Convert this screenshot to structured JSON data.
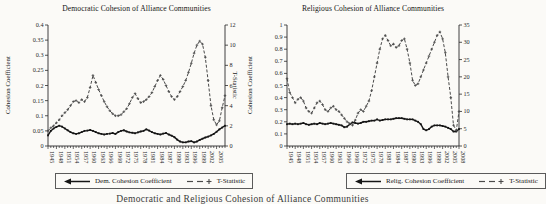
{
  "page": {
    "caption": "Democratic and Religious Cohesion of Alliance Communities"
  },
  "style": {
    "paper_color": "#fbfaf7",
    "axis_color": "#2b2b2b",
    "text_color": "#1e1e1e",
    "coefficient_line_color": "#151515",
    "tstat_line_color": "#4a4a4a"
  },
  "chart_data": [
    {
      "type": "line",
      "title": "Democratic Cohesion of Alliance Communities",
      "ylabel": "Cohesion Coefficient",
      "y2label": "T-Statistic",
      "ylim": [
        0,
        0.4
      ],
      "ytick_step": 0.05,
      "y2lim": [
        0,
        12
      ],
      "y2tick_step": 2,
      "grid": false,
      "legend_position": "bottom",
      "x": [
        1945,
        1946,
        1947,
        1948,
        1949,
        1950,
        1951,
        1952,
        1953,
        1954,
        1955,
        1956,
        1957,
        1958,
        1959,
        1960,
        1961,
        1962,
        1963,
        1964,
        1965,
        1966,
        1967,
        1968,
        1969,
        1970,
        1971,
        1972,
        1973,
        1974,
        1975,
        1976,
        1977,
        1978,
        1979,
        1980,
        1981,
        1982,
        1983,
        1984,
        1985,
        1986,
        1987,
        1988,
        1989,
        1990,
        1991,
        1992,
        1993,
        1994,
        1995,
        1996,
        1997,
        1998,
        1999,
        2000,
        2001,
        2002,
        2003,
        2004,
        2005,
        2006,
        2007,
        2008
      ],
      "xtick_labels": [
        "1945",
        "1948",
        "1951",
        "1954",
        "1957",
        "1960",
        "1963",
        "1966",
        "1969",
        "1972",
        "1975",
        "1978",
        "1981",
        "1984",
        "1987",
        "1990",
        "1993",
        "1996",
        "1999",
        "2002",
        "2005"
      ],
      "series": [
        {
          "name": "Dem. Cohesion Coefficient",
          "axis": "left",
          "style": "solid",
          "color": "#151515",
          "values": [
            0.035,
            0.05,
            0.058,
            0.063,
            0.067,
            0.064,
            0.058,
            0.052,
            0.046,
            0.042,
            0.04,
            0.042,
            0.046,
            0.05,
            0.051,
            0.053,
            0.05,
            0.046,
            0.042,
            0.04,
            0.038,
            0.04,
            0.041,
            0.043,
            0.04,
            0.046,
            0.05,
            0.052,
            0.048,
            0.045,
            0.044,
            0.042,
            0.045,
            0.048,
            0.05,
            0.055,
            0.051,
            0.046,
            0.042,
            0.04,
            0.038,
            0.041,
            0.043,
            0.038,
            0.034,
            0.029,
            0.021,
            0.015,
            0.012,
            0.012,
            0.015,
            0.016,
            0.012,
            0.015,
            0.02,
            0.024,
            0.028,
            0.031,
            0.035,
            0.04,
            0.047,
            0.055,
            0.061,
            0.067
          ]
        },
        {
          "name": "T-Statistic",
          "axis": "right",
          "style": "dashed",
          "color": "#4a4a4a",
          "values": [
            1.5,
            1.8,
            2.0,
            2.3,
            2.6,
            3.0,
            3.3,
            3.6,
            4.0,
            4.4,
            4.5,
            4.3,
            4.6,
            4.4,
            4.8,
            5.8,
            7.0,
            6.3,
            5.6,
            5.0,
            4.4,
            3.9,
            3.5,
            3.2,
            3.0,
            3.0,
            3.1,
            3.4,
            3.7,
            4.2,
            4.8,
            5.2,
            4.7,
            4.3,
            4.4,
            4.6,
            4.9,
            5.3,
            5.9,
            6.5,
            7.0,
            6.6,
            6.0,
            5.4,
            4.9,
            4.6,
            4.9,
            5.4,
            5.9,
            6.5,
            7.3,
            8.2,
            9.2,
            10.0,
            10.4,
            10.1,
            8.8,
            6.5,
            4.0,
            2.6,
            2.1,
            2.5,
            3.8,
            5.0
          ]
        }
      ]
    },
    {
      "type": "line",
      "title": "Religious Cohesion of Alliance Communities",
      "ylabel": "Cohesion Coefficient",
      "y2label": "",
      "ylim": [
        0,
        1
      ],
      "ytick_step": 0.1,
      "y2lim": [
        0,
        35
      ],
      "y2tick_step": 5,
      "grid": false,
      "legend_position": "bottom",
      "x": [
        1945,
        1946,
        1947,
        1948,
        1949,
        1950,
        1951,
        1952,
        1953,
        1954,
        1955,
        1956,
        1957,
        1958,
        1959,
        1960,
        1961,
        1962,
        1963,
        1964,
        1965,
        1966,
        1967,
        1968,
        1969,
        1970,
        1971,
        1972,
        1973,
        1974,
        1975,
        1976,
        1977,
        1978,
        1979,
        1980,
        1981,
        1982,
        1983,
        1984,
        1985,
        1986,
        1987,
        1988,
        1989,
        1990,
        1991,
        1992,
        1993,
        1994,
        1995,
        1996,
        1997,
        1998,
        1999,
        2000,
        2001,
        2002,
        2003,
        2004,
        2005,
        2006,
        2007,
        2008
      ],
      "xtick_labels": [
        "1945",
        "1948",
        "1951",
        "1954",
        "1957",
        "1960",
        "1963",
        "1966",
        "1969",
        "1972",
        "1975",
        "1978",
        "1981",
        "1984",
        "1987",
        "1990",
        "1993",
        "1996",
        "1999",
        "2002",
        "2005",
        "2008"
      ],
      "series": [
        {
          "name": "Relig. Cohesion Coefficient",
          "axis": "left",
          "style": "solid",
          "color": "#151515",
          "values": [
            0.18,
            0.185,
            0.18,
            0.185,
            0.18,
            0.185,
            0.19,
            0.18,
            0.175,
            0.18,
            0.185,
            0.18,
            0.19,
            0.185,
            0.18,
            0.185,
            0.19,
            0.185,
            0.18,
            0.175,
            0.17,
            0.155,
            0.16,
            0.18,
            0.195,
            0.19,
            0.185,
            0.19,
            0.2,
            0.2,
            0.205,
            0.21,
            0.21,
            0.22,
            0.21,
            0.215,
            0.22,
            0.22,
            0.22,
            0.225,
            0.23,
            0.23,
            0.23,
            0.225,
            0.22,
            0.22,
            0.22,
            0.21,
            0.2,
            0.18,
            0.14,
            0.13,
            0.14,
            0.16,
            0.17,
            0.17,
            0.17,
            0.165,
            0.16,
            0.15,
            0.14,
            0.12,
            0.12,
            0.14
          ]
        },
        {
          "name": "T-Statistic",
          "axis": "right",
          "style": "dashed",
          "color": "#4a4a4a",
          "values": [
            19.5,
            15.5,
            14,
            12.5,
            13.5,
            14,
            13,
            11,
            10,
            9.5,
            11,
            12.5,
            13,
            12,
            10.5,
            10,
            11,
            11.5,
            10.5,
            10,
            9,
            8,
            7,
            6.5,
            6,
            7.5,
            9.5,
            10.5,
            10,
            11.5,
            13,
            16,
            20,
            24,
            28,
            31,
            32,
            30.5,
            29,
            29.5,
            28.5,
            29,
            30.5,
            31,
            28,
            24,
            19,
            17.5,
            18,
            20,
            22,
            24,
            26,
            28,
            30,
            32,
            33,
            31,
            27,
            20,
            14,
            6,
            4.5,
            10
          ]
        }
      ]
    }
  ]
}
